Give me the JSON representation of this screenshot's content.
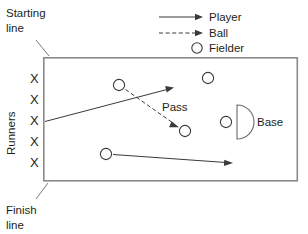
{
  "diagram": {
    "title_text_present": false,
    "labels": {
      "starting_line": [
        "Starting",
        "line"
      ],
      "finish_line": [
        "Finish",
        "line"
      ],
      "runners": "Runners",
      "pass": "Pass",
      "base": "Base"
    },
    "legend": {
      "items": [
        {
          "label": "Player",
          "symbol": "solid-arrow"
        },
        {
          "label": "Ball",
          "symbol": "dashed-arrow"
        },
        {
          "label": "Fielder",
          "symbol": "circle"
        }
      ]
    },
    "runner_marks": {
      "glyph": "X",
      "count": 5,
      "positions": [
        {
          "x": 36,
          "y": 78
        },
        {
          "x": 36,
          "y": 99
        },
        {
          "x": 36,
          "y": 120
        },
        {
          "x": 36,
          "y": 141
        },
        {
          "x": 36,
          "y": 162
        }
      ]
    },
    "field_box": {
      "x": 43,
      "y": 57,
      "width": 255,
      "height": 124
    },
    "fielders": [
      {
        "name": "fielder-upper-left",
        "cx": 119,
        "cy": 85,
        "r": 5.5
      },
      {
        "name": "fielder-upper-right",
        "cx": 208,
        "cy": 78,
        "r": 5.5
      },
      {
        "name": "fielder-ball-receiver",
        "cx": 185,
        "cy": 130,
        "r": 5.5
      },
      {
        "name": "fielder-lower-left",
        "cx": 106,
        "cy": 154,
        "r": 5.5
      },
      {
        "name": "fielder-base",
        "cx": 226,
        "cy": 122,
        "r": 5.5
      }
    ],
    "player_arrows": [
      {
        "name": "runner-path-arrow",
        "x1": 45,
        "y1": 121,
        "x2": 172,
        "y2": 88
      },
      {
        "name": "lower-player-arrow",
        "x1": 114,
        "y1": 154,
        "x2": 232,
        "y2": 163
      }
    ],
    "ball_arrows": [
      {
        "name": "pass-ball-arrow",
        "x1": 126,
        "y1": 89,
        "x2": 177,
        "y2": 125
      }
    ],
    "base": {
      "cx": 234,
      "cy": 122,
      "radius": 17
    },
    "leader_lines": [
      {
        "name": "starting-line-leader",
        "x1": 36,
        "y1": 40,
        "x2": 48,
        "y2": 55
      },
      {
        "name": "finish-line-leader",
        "x1": 47,
        "y1": 184,
        "x2": 36,
        "y2": 198
      }
    ],
    "colors": {
      "ink": "#231f20",
      "line": "#3a3a3a",
      "box_border": "#8a8a8a",
      "background": "#ffffff"
    }
  }
}
